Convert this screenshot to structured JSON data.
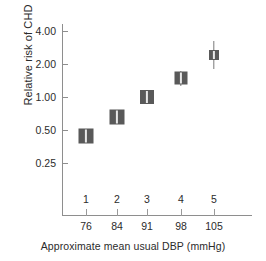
{
  "chart_data": {
    "type": "scatter",
    "title": "",
    "xlabel": "Approximate mean usual DBP (mmHg)",
    "ylabel": "Relative risk of CHD",
    "y_scale": "log",
    "ylim": [
      0.21,
      4.8
    ],
    "grid": false,
    "legend": null,
    "y_ticks": [
      "4.00",
      "2.00",
      "1.00",
      "0.50",
      "0.25"
    ],
    "y_tick_values": [
      4.0,
      2.0,
      1.0,
      0.5,
      0.25
    ],
    "x_group_labels": [
      "1",
      "2",
      "3",
      "4",
      "5"
    ],
    "x_tick_labels": [
      "76",
      "84",
      "91",
      "98",
      "105"
    ],
    "x": [
      76,
      84,
      91,
      98,
      105
    ],
    "values": [
      0.5,
      0.73,
      1.02,
      1.55,
      2.5
    ],
    "marker_style": "weighted-square-with-ci",
    "marker_color": "#595959",
    "ci_color": "#e8e8e8",
    "axis_color": "#8e8e8e",
    "points": [
      {
        "group": "1",
        "dbp": "76",
        "risk": 0.5,
        "px": 86,
        "py": 136,
        "size": 15,
        "ci_height": 13,
        "err_top": 0,
        "err_bottom": 0
      },
      {
        "group": "2",
        "dbp": "84",
        "risk": 0.73,
        "px": 117,
        "py": 117,
        "size": 15,
        "ci_height": 13,
        "err_top": 0,
        "err_bottom": 0
      },
      {
        "group": "3",
        "dbp": "91",
        "risk": 1.02,
        "px": 147,
        "py": 97,
        "size": 14,
        "ci_height": 12,
        "err_top": 0,
        "err_bottom": 0
      },
      {
        "group": "4",
        "dbp": "98",
        "risk": 1.55,
        "px": 181,
        "py": 78,
        "size": 13,
        "ci_height": 11,
        "err_top": 1,
        "err_bottom": 1
      },
      {
        "group": "5",
        "dbp": "105",
        "risk": 2.5,
        "px": 214,
        "py": 55,
        "size": 10,
        "ci_height": 8,
        "err_top": 9,
        "err_bottom": 9
      }
    ],
    "y_tick_pixels": [
      31,
      64,
      97,
      130,
      163
    ],
    "x_tick_pixels": [
      86,
      117,
      147,
      181,
      214
    ]
  }
}
